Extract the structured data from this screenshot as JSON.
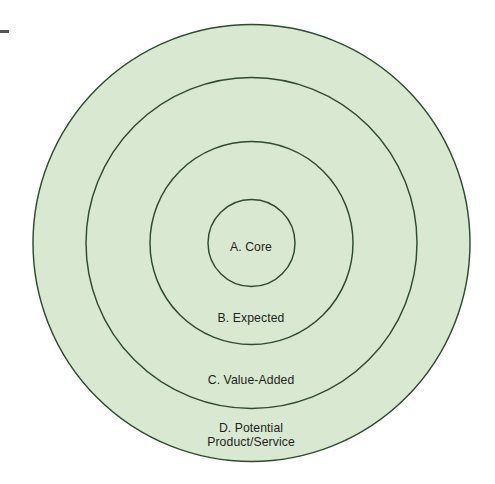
{
  "diagram": {
    "type": "concentric-circles",
    "canvas": {
      "width": 495,
      "height": 484,
      "background": "#ffffff"
    },
    "center": {
      "x": 251.5,
      "y": 243
    },
    "style": {
      "fill": "#d9e8d0",
      "stroke": "#2f4a30",
      "stroke_width": 1.45,
      "text_color": "#231f20"
    },
    "rings": [
      {
        "id": "d-potential",
        "order": 4,
        "radius": 218.5,
        "label": "D. Potential",
        "label_line2": "Product/Service",
        "label_full": "D. Potential Product/Service"
      },
      {
        "id": "c-value-added",
        "order": 3,
        "radius": 165.5,
        "label": "C. Value-Added",
        "label_full": "C. Value-Added"
      },
      {
        "id": "b-expected",
        "order": 2,
        "radius": 101.5,
        "label": "B. Expected",
        "label_full": "B. Expected"
      },
      {
        "id": "a-core",
        "order": 1,
        "radius": 43.5,
        "label": "A. Core",
        "label_full": "A. Core"
      }
    ],
    "artifacts": [
      {
        "id": "corner-mark",
        "kind": "scan-mark",
        "x": 0,
        "y": 30,
        "width": 9,
        "height": 3,
        "color": "#555558"
      }
    ]
  }
}
